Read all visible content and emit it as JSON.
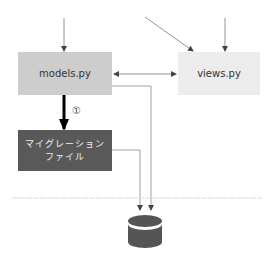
{
  "diagram": {
    "nodes": {
      "models": {
        "label": "models.py",
        "color": "#cdcdcd"
      },
      "views": {
        "label": "views.py",
        "color": "#ececec"
      },
      "migration": {
        "label_line1": "マイグレーション",
        "label_line2": "ファイル",
        "color": "#595959",
        "text_color": "#f2f2f2"
      },
      "database": {
        "label": "",
        "icon": "database-icon",
        "color": "#555555"
      }
    },
    "edges": [
      {
        "from": "top",
        "to": "models",
        "style": "thin-arrow"
      },
      {
        "from": "top",
        "to": "views",
        "style": "thin-arrow"
      },
      {
        "from": "top-diagonal",
        "to": "views",
        "style": "thin-arrow"
      },
      {
        "from": "models",
        "to": "views",
        "style": "double-arrow"
      },
      {
        "from": "models",
        "to": "database",
        "style": "elbow-arrow"
      },
      {
        "from": "migration",
        "to": "database",
        "style": "elbow-arrow"
      },
      {
        "from": "models",
        "to": "migration",
        "style": "thick-arrow",
        "label": "①"
      }
    ],
    "step_label": "①",
    "separator": {
      "style": "dashed",
      "color": "#dddddd"
    }
  }
}
